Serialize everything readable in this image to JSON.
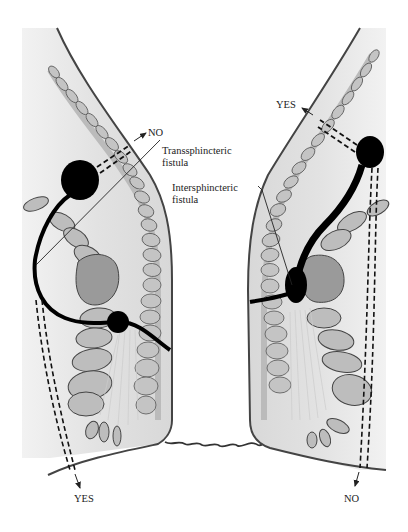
{
  "diagram": {
    "labels": {
      "no_top_left": "NO",
      "transsphincteric_line1": "Transsphincteric",
      "transsphincteric_line2": "fistula",
      "intersphincteric_line1": "Intersphincteric",
      "intersphincteric_line2": "fistula",
      "yes_top_right": "YES",
      "yes_bottom_left": "YES",
      "no_bottom_right": "NO"
    },
    "colors": {
      "tissue": "#e4e4e4",
      "muscle_fill": "#b8b8b8",
      "outline": "#333333",
      "fistula": "#000000",
      "background": "#ffffff"
    }
  }
}
